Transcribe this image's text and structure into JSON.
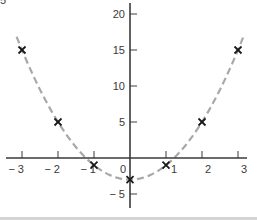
{
  "chart_data": {
    "type": "scatter",
    "title": "",
    "xlabel": "",
    "ylabel": "",
    "xlim": [
      -3.3,
      3.2
    ],
    "ylim": [
      -7,
      21.5
    ],
    "grid": false,
    "legend": null,
    "x_ticks": [
      -3,
      -2,
      -1,
      0,
      1,
      2,
      3
    ],
    "x_tick_labels": [
      "− 3",
      "− 2",
      "− 1",
      "0",
      "1",
      "2",
      "3"
    ],
    "y_ticks": [
      -5,
      0,
      5,
      10,
      15,
      20
    ],
    "y_tick_labels": [
      "− 5",
      "",
      "5",
      "10",
      "15",
      "20"
    ],
    "series": [
      {
        "name": "data points",
        "marker": "x",
        "color": "#1a1a1a",
        "x": [
          -3,
          -2,
          -1,
          0,
          1,
          2,
          3
        ],
        "y": [
          15,
          5,
          -1,
          -3,
          -1,
          5,
          15
        ]
      },
      {
        "name": "fitted curve",
        "style": "dashed",
        "color": "#a8a8a8",
        "equation": "y = 2x^2 - 3",
        "x_range": [
          -3.15,
          3.15
        ]
      }
    ]
  },
  "colors": {
    "axis": "#3a3a3a",
    "marker": "#1a1a1a",
    "curve": "#a8a8a8",
    "bottom_rule": "#d4d4d4"
  }
}
